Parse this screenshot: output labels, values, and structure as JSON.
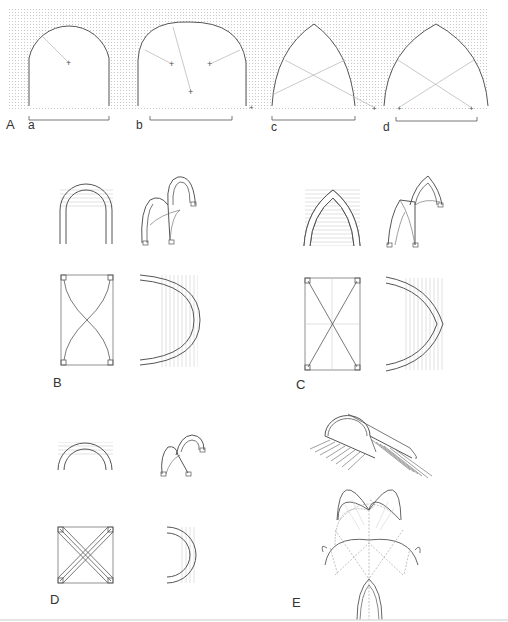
{
  "figure": {
    "panels": [
      {
        "id": "A",
        "label": "A",
        "description": "Arch profiles compared",
        "sub": [
          {
            "label": "a"
          },
          {
            "label": "b"
          },
          {
            "label": "c"
          },
          {
            "label": "d"
          }
        ]
      },
      {
        "id": "B",
        "label": "B",
        "description": "Round-arch rib vault: elevation, perspective, plan, section"
      },
      {
        "id": "C",
        "label": "C",
        "description": "Pointed-arch rib vault: elevation, perspective, plan, section"
      },
      {
        "id": "D",
        "label": "D",
        "description": "Square-bay rib vault: elevation, perspective, plan, section"
      },
      {
        "id": "E",
        "label": "E",
        "description": "Barrel vault thrust and intersecting vault construction"
      }
    ]
  },
  "colors": {
    "line": "#555555",
    "light": "#bbbbbb",
    "stipple": "#cfcfcf"
  }
}
